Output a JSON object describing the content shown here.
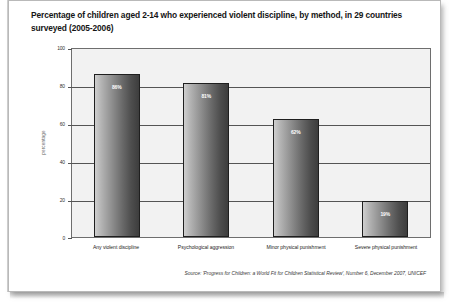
{
  "title": "Percentage of children aged 2-14 who experienced violent discipline, by method, in 29 countries surveyed (2005-2006)",
  "source": "Source: 'Progress for Children: a World Fit for Children Statistical Review', Number 6, December 2007, UNICEF",
  "chart_data": {
    "type": "bar",
    "title": "Percentage of children aged 2-14 who experienced violent discipline, by method, in 29 countries surveyed (2005-2006)",
    "categories": [
      "Any violent discipline",
      "Psychological aggression",
      "Minor physical punishment",
      "Severe physical punishment"
    ],
    "values": [
      86,
      81,
      62,
      19
    ],
    "data_labels": [
      "86%",
      "81%",
      "62%",
      "19%"
    ],
    "xlabel": "",
    "ylabel": "percentage",
    "ylim": [
      0,
      100
    ],
    "yticks": [
      0,
      20,
      40,
      60,
      80,
      100
    ],
    "ytick_labels": [
      "0",
      "20",
      "40",
      "60",
      "80",
      "100"
    ],
    "grid": true,
    "legend": false,
    "bar_color_start": "#cfcfcf",
    "bar_color_end": "#3d3d3d",
    "bar_outline": "#1f1f1f",
    "plot_background": "#f2f2f2"
  }
}
